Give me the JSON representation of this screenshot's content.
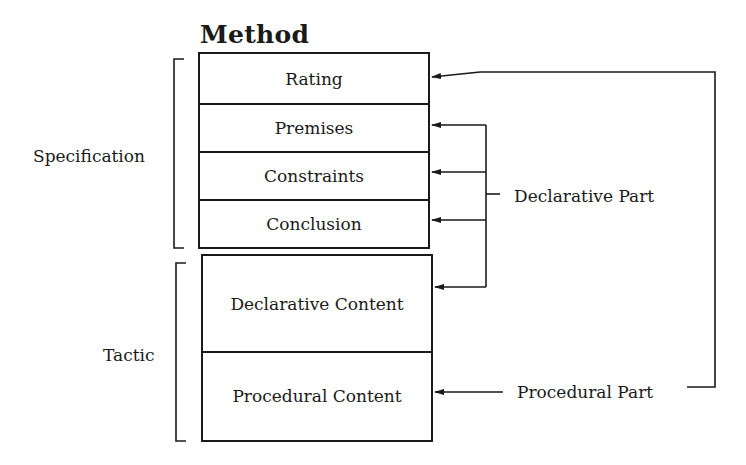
{
  "diagram": {
    "title": "Method",
    "specification": {
      "label": "Specification",
      "rows": [
        {
          "label": "Rating"
        },
        {
          "label": "Premises"
        },
        {
          "label": "Constraints"
        },
        {
          "label": "Conclusion"
        }
      ]
    },
    "tactic": {
      "label": "Tactic",
      "rows": [
        {
          "label": "Declarative Content"
        },
        {
          "label": "Procedural Content"
        }
      ]
    },
    "annotations": {
      "declarative_part": "Declarative Part",
      "procedural_part": "Procedural Part"
    },
    "colors": {
      "ink": "#1a1a1a",
      "background": "#ffffff"
    }
  }
}
